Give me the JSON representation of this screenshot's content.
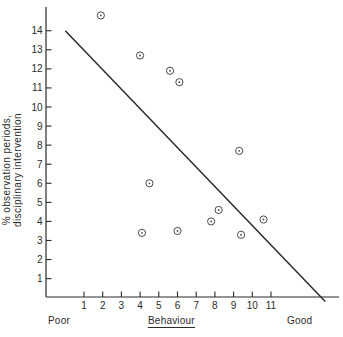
{
  "colors": {
    "ink": "#2b2b2b",
    "marker": "#4a4a4a",
    "background": "#ffffff"
  },
  "chart_data": {
    "type": "scatter",
    "title": "",
    "xlabel": "Behaviour",
    "x_left_label": "Poor",
    "x_right_label": "Good",
    "ylabel_line1": "% observation periods,",
    "ylabel_line2": "disciplinary intervention",
    "x_ticks": [
      1,
      2,
      3,
      4,
      5,
      6,
      7,
      8,
      9,
      10,
      11
    ],
    "y_ticks": [
      1,
      2,
      3,
      4,
      5,
      6,
      7,
      8,
      9,
      10,
      11,
      12,
      13,
      14
    ],
    "xlim": [
      -1.0,
      14.6
    ],
    "ylim": [
      0,
      15.2
    ],
    "grid": false,
    "legend": false,
    "marker_style": "circled-dot",
    "points": [
      [
        1.9,
        14.8
      ],
      [
        4.0,
        12.7
      ],
      [
        5.6,
        11.9
      ],
      [
        6.1,
        11.3
      ],
      [
        9.3,
        7.7
      ],
      [
        4.5,
        6.0
      ],
      [
        4.1,
        3.4
      ],
      [
        6.0,
        3.5
      ],
      [
        7.8,
        4.0
      ],
      [
        8.2,
        4.6
      ],
      [
        9.4,
        3.3
      ],
      [
        10.6,
        4.1
      ]
    ],
    "trend_line": {
      "x1": 0,
      "y1": 14.0,
      "x2": 13.9,
      "y2": -0.2
    }
  }
}
